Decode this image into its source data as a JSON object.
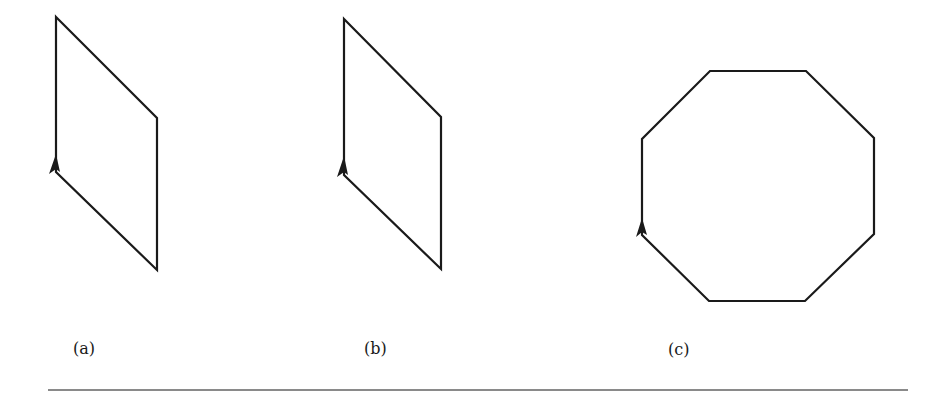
{
  "figure": {
    "stroke_color": "#1a1a1a",
    "rule_color": "#8a8a8a",
    "panels": [
      {
        "id": "a",
        "label": "(a)",
        "shape": "parallelogram",
        "points": [
          [
            56,
            17
          ],
          [
            157,
            118
          ],
          [
            157,
            270
          ],
          [
            56,
            172
          ]
        ],
        "arrow": {
          "direction": "up",
          "points": [
            [
              56,
              154
            ],
            [
              49,
              174
            ],
            [
              56,
              169
            ],
            [
              60,
              172
            ]
          ]
        }
      },
      {
        "id": "b",
        "label": "(b)",
        "shape": "parallelogram",
        "points": [
          [
            344,
            19
          ],
          [
            441,
            117
          ],
          [
            441,
            269
          ],
          [
            344,
            175
          ]
        ],
        "arrow": {
          "direction": "up",
          "points": [
            [
              344,
              156
            ],
            [
              337,
              177
            ],
            [
              344,
              172
            ],
            [
              348,
              175
            ]
          ]
        }
      },
      {
        "id": "c",
        "label": "(c)",
        "shape": "octagon",
        "points": [
          [
            710,
            71
          ],
          [
            806,
            71
          ],
          [
            874,
            138
          ],
          [
            874,
            234
          ],
          [
            805,
            301
          ],
          [
            709,
            301
          ],
          [
            642,
            235
          ],
          [
            642,
            139
          ]
        ],
        "arrow": {
          "direction": "up",
          "points": [
            [
              642,
              218
            ],
            [
              636,
              237
            ],
            [
              642,
              232
            ],
            [
              647,
              235
            ]
          ]
        }
      }
    ]
  }
}
